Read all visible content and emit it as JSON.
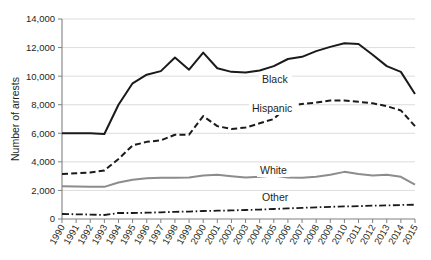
{
  "chart_data": {
    "type": "line",
    "title": "",
    "xlabel": "",
    "ylabel": "Number of arrests",
    "ylim": [
      0,
      14000
    ],
    "ytick_values": [
      0,
      2000,
      4000,
      6000,
      8000,
      10000,
      12000,
      14000
    ],
    "ytick_labels": [
      "0",
      "2,000",
      "4,000",
      "6,000",
      "8,000",
      "10,000",
      "12,000",
      "14,000"
    ],
    "grid": true,
    "legend_position": "inline-labels",
    "categories": [
      "1990",
      "1991",
      "1992",
      "1993",
      "1994",
      "1995",
      "1996",
      "1997",
      "1998",
      "1999",
      "2000",
      "2001",
      "2002",
      "2003",
      "2004",
      "2005",
      "2006",
      "2007",
      "2008",
      "2009",
      "2010",
      "2011",
      "2012",
      "2013",
      "2014",
      "2015"
    ],
    "series": [
      {
        "name": "Black",
        "color": "#1a1a1a",
        "style": "solid",
        "width": 2.0,
        "values": [
          6000,
          6000,
          6000,
          5950,
          8000,
          9500,
          10100,
          10350,
          11300,
          10450,
          11650,
          10550,
          10300,
          10250,
          10400,
          10700,
          11200,
          11350,
          11750,
          12050,
          12300,
          12250,
          11500,
          10700,
          10300,
          8750
        ]
      },
      {
        "name": "Hispanic",
        "color": "#1a1a1a",
        "style": "dashed",
        "width": 2.0,
        "values": [
          3150,
          3200,
          3250,
          3400,
          4200,
          5150,
          5400,
          5500,
          5900,
          5900,
          7200,
          6500,
          6300,
          6400,
          6700,
          7000,
          7950,
          8050,
          8150,
          8300,
          8300,
          8200,
          8100,
          7900,
          7600,
          6500
        ]
      },
      {
        "name": "White",
        "color": "#8c8c8c",
        "style": "solid",
        "width": 2.0,
        "values": [
          2300,
          2280,
          2250,
          2250,
          2550,
          2750,
          2850,
          2880,
          2880,
          2900,
          3050,
          3100,
          3000,
          2900,
          2950,
          3050,
          2900,
          2880,
          2950,
          3100,
          3300,
          3150,
          3050,
          3100,
          2950,
          2400
        ]
      },
      {
        "name": "Other",
        "color": "#1a1a1a",
        "style": "dashdot",
        "width": 1.8,
        "values": [
          350,
          330,
          310,
          280,
          420,
          420,
          440,
          470,
          500,
          520,
          560,
          580,
          600,
          630,
          660,
          700,
          740,
          780,
          820,
          850,
          880,
          900,
          930,
          950,
          980,
          1000
        ]
      }
    ],
    "series_inline_labels": [
      {
        "name": "Black",
        "text": "Black",
        "x": 262,
        "y": 83
      },
      {
        "name": "Hispanic",
        "text": "Hispanic",
        "x": 252,
        "y": 112
      },
      {
        "name": "White",
        "text": "White",
        "x": 260,
        "y": 174
      },
      {
        "name": "Other",
        "text": "Other",
        "x": 262,
        "y": 201
      }
    ]
  },
  "plot_geometry": {
    "left": 62,
    "right": 415,
    "top": 19,
    "bottom": 219
  }
}
